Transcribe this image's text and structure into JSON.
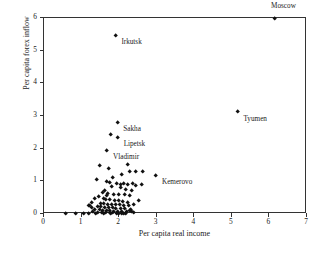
{
  "chart_data": {
    "type": "scatter",
    "title": "",
    "xlabel": "Per capita real income",
    "ylabel": "Per capita forex inflow",
    "xlim": [
      0,
      7
    ],
    "ylim": [
      0,
      6
    ],
    "xticks": [
      0,
      1,
      2,
      3,
      4,
      5,
      6,
      7
    ],
    "yticks": [
      0,
      1,
      2,
      3,
      4,
      5,
      6
    ],
    "xticklabels": [
      "0",
      "1",
      "2",
      "3",
      "4",
      "5",
      "6",
      "7"
    ],
    "yticklabels": [
      "0",
      "1",
      "2",
      "3",
      "4",
      "5",
      "6"
    ],
    "grid": false,
    "legend": null,
    "marker": "diamond",
    "marker_color": "#111111",
    "annotations": [
      {
        "label": "Moscow",
        "x": 6.15,
        "y": 5.98,
        "dx": -4,
        "dy": 16
      },
      {
        "label": "Irkutsk",
        "x": 1.9,
        "y": 5.45,
        "dx": 6,
        "dy": -3.5
      },
      {
        "label": "Tyumen",
        "x": 5.15,
        "y": 3.12,
        "dx": 6,
        "dy": -3.5
      },
      {
        "label": "Sakha",
        "x": 1.95,
        "y": 2.8,
        "dx": 6,
        "dy": -3.5
      },
      {
        "label": "Lipetsk",
        "x": 1.96,
        "y": 2.34,
        "dx": 6,
        "dy": -3.5
      },
      {
        "label": "Vladimir",
        "x": 1.68,
        "y": 1.95,
        "dx": 6,
        "dy": -3.5
      },
      {
        "label": "Kemerovo",
        "x": 2.98,
        "y": 1.17,
        "dx": 6,
        "dy": -3.5
      }
    ],
    "points": [
      [
        6.15,
        5.98
      ],
      [
        1.9,
        5.45
      ],
      [
        5.15,
        3.12
      ],
      [
        1.95,
        2.8
      ],
      [
        1.96,
        2.34
      ],
      [
        1.77,
        2.42
      ],
      [
        1.68,
        1.95
      ],
      [
        2.98,
        1.17
      ],
      [
        1.47,
        1.47
      ],
      [
        1.72,
        1.4
      ],
      [
        2.22,
        1.5
      ],
      [
        2.27,
        1.28
      ],
      [
        2.44,
        1.31
      ],
      [
        2.62,
        1.3
      ],
      [
        2.07,
        1.21
      ],
      [
        1.83,
        1.1
      ],
      [
        1.4,
        1.04
      ],
      [
        1.68,
        1.0
      ],
      [
        1.74,
        0.95
      ],
      [
        1.93,
        0.93
      ],
      [
        2.05,
        0.91
      ],
      [
        2.13,
        0.92
      ],
      [
        2.24,
        0.9
      ],
      [
        2.35,
        0.92
      ],
      [
        2.45,
        0.88
      ],
      [
        2.6,
        0.89
      ],
      [
        1.8,
        0.84
      ],
      [
        2.03,
        0.8
      ],
      [
        2.18,
        0.75
      ],
      [
        2.33,
        0.71
      ],
      [
        1.62,
        0.72
      ],
      [
        1.55,
        0.66
      ],
      [
        1.7,
        0.62
      ],
      [
        1.86,
        0.6
      ],
      [
        2.0,
        0.58
      ],
      [
        2.14,
        0.6
      ],
      [
        2.28,
        0.55
      ],
      [
        1.46,
        0.52
      ],
      [
        1.36,
        0.48
      ],
      [
        1.58,
        0.46
      ],
      [
        1.64,
        0.43
      ],
      [
        1.76,
        0.44
      ],
      [
        1.88,
        0.41
      ],
      [
        1.98,
        0.4
      ],
      [
        2.1,
        0.38
      ],
      [
        2.22,
        0.36
      ],
      [
        1.28,
        0.36
      ],
      [
        1.5,
        0.33
      ],
      [
        1.6,
        0.31
      ],
      [
        1.7,
        0.3
      ],
      [
        1.8,
        0.29
      ],
      [
        1.9,
        0.28
      ],
      [
        2.02,
        0.27
      ],
      [
        2.12,
        0.26
      ],
      [
        2.26,
        0.25
      ],
      [
        1.22,
        0.24
      ],
      [
        1.42,
        0.22
      ],
      [
        1.52,
        0.21
      ],
      [
        1.62,
        0.2
      ],
      [
        1.72,
        0.19
      ],
      [
        1.82,
        0.18
      ],
      [
        1.92,
        0.17
      ],
      [
        2.04,
        0.16
      ],
      [
        2.16,
        0.15
      ],
      [
        2.3,
        0.14
      ],
      [
        1.34,
        0.14
      ],
      [
        1.48,
        0.12
      ],
      [
        1.56,
        0.11
      ],
      [
        1.66,
        0.1
      ],
      [
        1.76,
        0.09
      ],
      [
        1.86,
        0.08
      ],
      [
        1.96,
        0.08
      ],
      [
        2.08,
        0.07
      ],
      [
        2.2,
        0.06
      ],
      [
        2.34,
        0.06
      ],
      [
        1.3,
        0.06
      ],
      [
        1.44,
        0.05
      ],
      [
        1.54,
        0.04
      ],
      [
        1.64,
        0.04
      ],
      [
        1.74,
        0.03
      ],
      [
        1.84,
        0.03
      ],
      [
        1.94,
        0.02
      ],
      [
        2.06,
        0.02
      ],
      [
        2.18,
        0.02
      ],
      [
        2.28,
        0.1
      ],
      [
        2.38,
        0.04
      ],
      [
        1.2,
        0.02
      ],
      [
        1.38,
        0.02
      ],
      [
        1.58,
        0.01
      ],
      [
        1.78,
        0.01
      ],
      [
        1.98,
        0.01
      ],
      [
        2.12,
        0.01
      ],
      [
        1.05,
        0.02
      ],
      [
        0.85,
        0.02
      ],
      [
        0.57,
        0.02
      ],
      [
        1.26,
        0.18
      ],
      [
        1.18,
        0.26
      ],
      [
        2.4,
        0.3
      ],
      [
        2.52,
        0.42
      ],
      [
        1.66,
        0.56
      ]
    ]
  }
}
